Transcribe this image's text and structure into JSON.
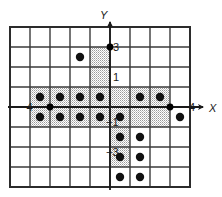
{
  "figure": {
    "title": "",
    "axes": {
      "x_axis_label": "X",
      "y_axis_label": "Y",
      "x_axis_name": "x-axis",
      "y_axis_name": "y-axis"
    },
    "tick_labels": [
      {
        "text": "3",
        "axis": "y",
        "value": 3,
        "px": 113,
        "py": 51
      },
      {
        "text": "1",
        "axis": "y",
        "value": 1,
        "px": 113,
        "py": 81
      },
      {
        "text": "−1",
        "axis": "y",
        "value": -1,
        "px": 106,
        "py": 126
      },
      {
        "text": "−3",
        "axis": "y",
        "value": -3,
        "px": 106,
        "py": 156
      },
      {
        "text": "−4",
        "axis": "x",
        "value": -4,
        "px": 20,
        "py": 111
      },
      {
        "text": "4",
        "axis": "x",
        "value": 4,
        "px": 189,
        "py": 111
      }
    ],
    "grid": {
      "visible": true,
      "cell_size": 20,
      "x_min": -5,
      "x_max": 4,
      "y_min": -4,
      "y_max": 4,
      "origin_px": {
        "x": 110,
        "y": 107
      },
      "border_color": "#2b2b2b",
      "line_color": "#3a3a3a"
    },
    "shading": {
      "fill_color": "#d9d9d9",
      "stipple": true,
      "regions": [
        {
          "name": "upper-stem",
          "x0": -1,
          "y0": 1,
          "x1": 0,
          "y1": 3
        },
        {
          "name": "horizontal-bar",
          "x0": -4,
          "y0": -1,
          "x1": 3,
          "y1": 1
        },
        {
          "name": "lower-stem",
          "x0": 0,
          "y0": -3,
          "x1": 1,
          "y1": -1
        }
      ]
    },
    "dots": {
      "color": "#111111",
      "radius": 4.2,
      "points": [
        {
          "x": -1.5,
          "y": 2.5
        },
        {
          "x": -3.5,
          "y": 0.5
        },
        {
          "x": -2.5,
          "y": 0.5
        },
        {
          "x": -1.5,
          "y": 0.5
        },
        {
          "x": -0.5,
          "y": 0.5
        },
        {
          "x": 1.5,
          "y": 0.5
        },
        {
          "x": 2.5,
          "y": 0.5
        },
        {
          "x": -3.5,
          "y": -0.5
        },
        {
          "x": -2.5,
          "y": -0.5
        },
        {
          "x": -1.5,
          "y": -0.5
        },
        {
          "x": -0.5,
          "y": -0.5
        },
        {
          "x": 0.5,
          "y": -0.5
        },
        {
          "x": 3.5,
          "y": -0.5
        },
        {
          "x": 0.5,
          "y": -1.5
        },
        {
          "x": 0.5,
          "y": -2.5
        },
        {
          "x": 0.5,
          "y": -3.5
        },
        {
          "x": 1.5,
          "y": -1.5
        },
        {
          "x": 1.5,
          "y": -2.5
        },
        {
          "x": 1.5,
          "y": -3.5
        }
      ]
    },
    "vertices": {
      "color": "#000000",
      "radius": 3.4,
      "points": [
        {
          "x": -3,
          "y": 0
        },
        {
          "x": 3,
          "y": 0
        },
        {
          "x": 0,
          "y": 3
        }
      ]
    }
  },
  "chart_data": {
    "type": "scatter",
    "title": "",
    "xlabel": "X",
    "ylabel": "Y",
    "xlim": [
      -5,
      4
    ],
    "ylim": [
      -4,
      4
    ],
    "grid": true,
    "legend": "none",
    "xticks": [
      -4,
      4
    ],
    "yticks": [
      3,
      1,
      -1,
      -3
    ],
    "series": [
      {
        "name": "dots",
        "x": [
          -1.5,
          -3.5,
          -2.5,
          -1.5,
          -0.5,
          1.5,
          2.5,
          -3.5,
          -2.5,
          -1.5,
          -0.5,
          0.5,
          3.5,
          0.5,
          0.5,
          0.5,
          1.5,
          1.5,
          1.5
        ],
        "y": [
          2.5,
          0.5,
          0.5,
          0.5,
          0.5,
          0.5,
          0.5,
          -0.5,
          -0.5,
          -0.5,
          -0.5,
          -0.5,
          -0.5,
          -1.5,
          -2.5,
          -3.5,
          -1.5,
          -2.5,
          -3.5
        ]
      }
    ],
    "annotations": [
      "Shaded cross/plus-shaped region on square grid with filled dots marking lattice cell centers"
    ]
  }
}
